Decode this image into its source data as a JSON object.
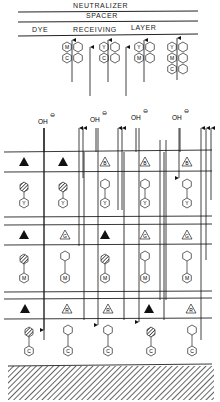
{
  "header": {
    "neutralizer": "NEUTRALIZER",
    "spacer": "SPACER",
    "dye": "DYE",
    "receiving": "RECEIVING",
    "layer": "LAYER"
  },
  "receiving_dyes": [
    {
      "dyes": [
        "M",
        "C"
      ]
    },
    {
      "dyes": [
        "Y",
        "C"
      ]
    },
    {
      "dyes": [
        "Y",
        "M"
      ]
    },
    {
      "dyes": [
        "Y",
        "M",
        "C"
      ]
    }
  ],
  "alkali": {
    "label": "OH",
    "charge": "⊖",
    "count": 4
  },
  "layers": [
    {
      "name": "blue-sensitive",
      "triangles": [
        "exposed",
        "exposed",
        "B",
        "B",
        "B"
      ],
      "developers": [
        "developed",
        "developed",
        "free",
        "free",
        "free"
      ],
      "dye": "Y"
    },
    {
      "name": "green-sensitive",
      "triangles": [
        "exposed",
        "G",
        "exposed",
        "G",
        "G"
      ],
      "developers": [
        "developed",
        "free",
        "developed",
        "free",
        "free"
      ],
      "dye": "M"
    },
    {
      "name": "red-sensitive",
      "triangles": [
        "exposed",
        "R",
        "R",
        "exposed",
        "R"
      ],
      "developers": [
        "developed",
        "free",
        "free",
        "developed",
        "free"
      ],
      "dye": "C"
    }
  ],
  "base": {
    "label": "base"
  }
}
